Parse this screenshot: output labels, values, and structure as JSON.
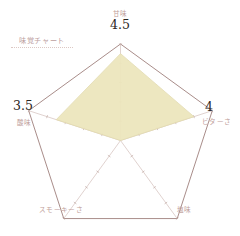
{
  "title": {
    "text": "味覚チャート"
  },
  "chart_data": {
    "type": "radar",
    "title": "味覚チャート",
    "categories": [
      "甘味",
      "ビターさ",
      "塩味",
      "スモーキーさ",
      "酸味"
    ],
    "values": [
      4.5,
      4,
      0,
      0,
      3.5
    ],
    "value_labels": [
      "4.5",
      "4",
      "",
      "",
      "3.5"
    ],
    "rmin": 0,
    "rmax": 5,
    "ticks": [
      1,
      2,
      3,
      4,
      5
    ],
    "grid": false,
    "legend": "none",
    "fill_color": "#ece6bd",
    "outline_color": "#a98d8a",
    "series": [
      {
        "name": "味覚",
        "values": [
          4.5,
          4,
          0,
          0,
          3.5
        ]
      }
    ]
  },
  "axes": [
    {
      "label": "甘味",
      "value": "4.5",
      "position": "top"
    },
    {
      "label": "ビターさ",
      "value": "4",
      "position": "right"
    },
    {
      "label": "塩味",
      "value": "",
      "position": "bottom-right"
    },
    {
      "label": "スモーキーさ",
      "value": "",
      "position": "bottom-left"
    },
    {
      "label": "酸味",
      "value": "3.5",
      "position": "left"
    }
  ],
  "colors": {
    "fill": "#ece6bd",
    "outline": "#a98d8a",
    "spoke": "#cbb4ae",
    "label": "#c0a09b",
    "value": "#2b2622",
    "background": "#ffffff"
  }
}
